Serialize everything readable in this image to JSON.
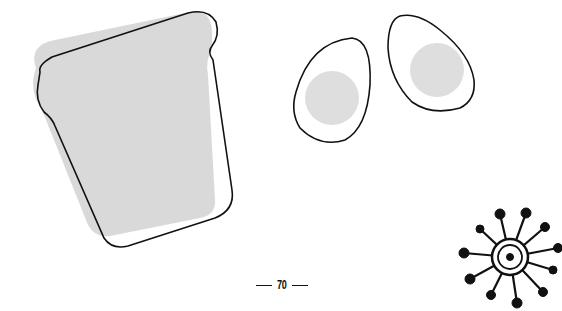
{
  "page": {
    "page_number": "70"
  },
  "illustrations": [
    {
      "name": "toast-slice",
      "fill": "#d9d9d9",
      "stroke": "#111111"
    },
    {
      "name": "egg-left",
      "yolk_fill": "#dedede",
      "stroke": "#111111"
    },
    {
      "name": "egg-right",
      "yolk_fill": "#dedede",
      "stroke": "#111111"
    },
    {
      "name": "sun-burst",
      "stroke": "#111111"
    }
  ]
}
